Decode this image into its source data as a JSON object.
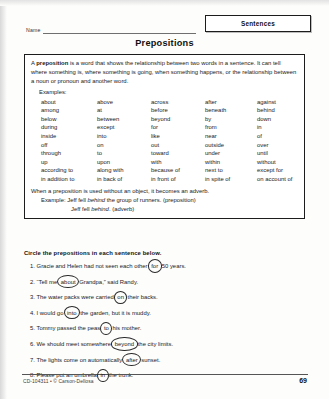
{
  "header": {
    "name_label": "Name",
    "subject_badge": "Sentences",
    "title": "Prepositions"
  },
  "info_box": {
    "definition_lead": "A ",
    "definition_bold": "preposition",
    "definition_rest": " is a word that shows the relationship between two words in a sentence. It can tell where something is, where something is going, when something happens, or the relationship between a noun or pronoun and another word.",
    "examples_label": "Examples:",
    "word_rows": [
      [
        "about",
        "above",
        "across",
        "after",
        "against"
      ],
      [
        "among",
        "at",
        "before",
        "beneath",
        "behind"
      ],
      [
        "below",
        "between",
        "beyond",
        "by",
        "down"
      ],
      [
        "during",
        "except",
        "for",
        "from",
        "in"
      ],
      [
        "inside",
        "into",
        "like",
        "near",
        "of"
      ],
      [
        "off",
        "on",
        "out",
        "outside",
        "over"
      ],
      [
        "through",
        "to",
        "toward",
        "under",
        "until"
      ],
      [
        "up",
        "upon",
        "with",
        "within",
        "without"
      ],
      [
        "according to",
        "along with",
        "because of",
        "next to",
        "except for"
      ],
      [
        "in addition to",
        "in back of",
        "in front of",
        "in spite of",
        "on account of"
      ]
    ],
    "adverb_note": "When a preposition is used without an object, it becomes an adverb.",
    "adverb_example_label": "Example:",
    "adverb_example_1_pre": " Jeff fell ",
    "adverb_example_1_italic": "behind",
    "adverb_example_1_post": " the group of runners.  (preposition)",
    "adverb_example_2_pre": "Jeff fell ",
    "adverb_example_2_italic": "behind",
    "adverb_example_2_post": ".  (adverb)"
  },
  "exercise": {
    "directions": "Circle the prepositions in each sentence below.",
    "items": [
      {
        "number": "1.",
        "pre": " Gracie and Helen had not seen each other ",
        "answer": "for",
        "post": " 50 years."
      },
      {
        "number": "2.",
        "pre": " “Tell me ",
        "answer": "about",
        "post": " Grandpa,” said Randy."
      },
      {
        "number": "3.",
        "pre": " The water packs were carried ",
        "answer": "on",
        "post": " their backs."
      },
      {
        "number": "4.",
        "pre": " I would go ",
        "answer": "into",
        "post": " the garden, but it is muddy."
      },
      {
        "number": "5.",
        "pre": " Tommy passed the peas ",
        "answer": "to",
        "post": " his mother."
      },
      {
        "number": "6.",
        "pre": " We should meet somewhere ",
        "answer": "beyond",
        "post": " the city limits."
      },
      {
        "number": "7.",
        "pre": " The lights come on automatically ",
        "answer": "after",
        "post": " sunset."
      },
      {
        "number": "8.",
        "pre": " Please put an umbrella ",
        "answer": "in",
        "post": " the trunk."
      }
    ]
  },
  "footer": {
    "code": "CD-104311 • © Carson-Dellosa",
    "page_number": "69"
  }
}
